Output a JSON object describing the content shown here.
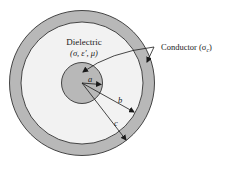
{
  "diagram": {
    "type": "coaxial-cross-section",
    "colors": {
      "conductor_fill": "#b8b8b8",
      "dielectric_fill": "#f2f2f2",
      "stroke": "#333333",
      "background": "#ffffff"
    },
    "labels": {
      "dielectric_title": "Dielectric",
      "dielectric_params": "(σ, ε′, μ)",
      "conductor": "Conductor (σ",
      "conductor_sub": "c",
      "conductor_close": ")",
      "radius_a": "a",
      "radius_b": "b",
      "radius_c": "c"
    },
    "geometry": {
      "center": [
        82,
        83
      ],
      "r_inner_conductor": 20.5,
      "r_outer_conductor_inner": 61,
      "r_outer_conductor_outer": 72.5
    }
  }
}
